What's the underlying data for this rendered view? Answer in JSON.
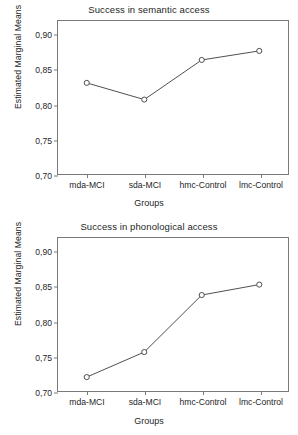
{
  "figure": {
    "axis_color": "#7a7a7a",
    "line_color": "#4d4d4d",
    "text_color": "#262626"
  },
  "panels": [
    {
      "title": "Success in semantic access",
      "xlabel": "Groups",
      "ylabel": "Estimated Marginal Means"
    },
    {
      "title": "Success in phonological access",
      "xlabel": "Groups",
      "ylabel": "Estimated Marginal Means"
    }
  ],
  "chart_data": [
    {
      "type": "line",
      "title": "Success in semantic access",
      "xlabel": "Groups",
      "ylabel": "Estimated Marginal Means",
      "categories": [
        "mda-MCI",
        "sda-MCI",
        "hmc-Control",
        "lmc-Control"
      ],
      "values": [
        0.831,
        0.807,
        0.864,
        0.877
      ],
      "ylim": [
        0.7,
        0.92
      ],
      "yticks": [
        0.7,
        0.75,
        0.8,
        0.85,
        0.9
      ],
      "ytick_labels": [
        "0,70",
        "0,75",
        "0,80",
        "0,85",
        "0,90"
      ],
      "grid": false,
      "legend": false,
      "markers": "open-circle"
    },
    {
      "type": "line",
      "title": "Success in phonological access",
      "xlabel": "Groups",
      "ylabel": "Estimated Marginal Means",
      "categories": [
        "mda-MCI",
        "sda-MCI",
        "hmc-Control",
        "lmc-Control"
      ],
      "values": [
        0.72,
        0.756,
        0.838,
        0.853
      ],
      "ylim": [
        0.7,
        0.92
      ],
      "yticks": [
        0.7,
        0.75,
        0.8,
        0.85,
        0.9
      ],
      "ytick_labels": [
        "0,70",
        "0,75",
        "0,80",
        "0,85",
        "0,90"
      ],
      "grid": false,
      "legend": false,
      "markers": "open-circle"
    }
  ]
}
